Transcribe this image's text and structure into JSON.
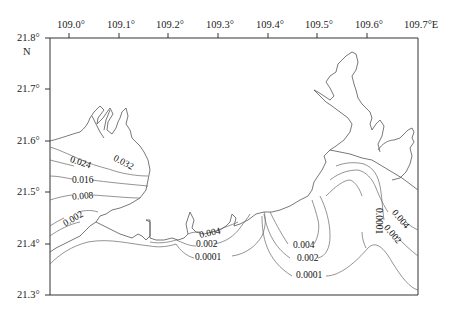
{
  "map": {
    "type": "contour map",
    "frame": {
      "left": 50,
      "right": 418,
      "top": 38,
      "bottom": 295
    },
    "longitude_ticks": [
      {
        "label": "109.0°",
        "x": 69
      },
      {
        "label": "109.1°",
        "x": 119
      },
      {
        "label": "109.2°",
        "x": 168
      },
      {
        "label": "109.3°",
        "x": 218
      },
      {
        "label": "109.4°",
        "x": 268
      },
      {
        "label": "109.5°",
        "x": 317
      },
      {
        "label": "109.6°",
        "x": 367
      },
      {
        "label": "109.7°E",
        "x": 418
      }
    ],
    "latitude_ticks": [
      {
        "label": "21.8°",
        "y": 38
      },
      {
        "label": "21.7°",
        "y": 89
      },
      {
        "label": "21.6°",
        "y": 141
      },
      {
        "label": "21.5°",
        "y": 192
      },
      {
        "label": "21.4°",
        "y": 244
      },
      {
        "label": "21.3°",
        "y": 295
      }
    ],
    "north_label": "N",
    "contour_labels": [
      {
        "text": "0.024",
        "x": 70,
        "y": 165,
        "rot": 18
      },
      {
        "text": "0.032",
        "x": 113,
        "y": 165,
        "rot": 28
      },
      {
        "text": "0.016",
        "x": 72,
        "y": 181,
        "rot": 0
      },
      {
        "text": "0.008",
        "x": 72,
        "y": 197,
        "rot": -5
      },
      {
        "text": "0.002",
        "x": 62,
        "y": 220,
        "rot": -30
      },
      {
        "text": "0.004",
        "x": 200,
        "y": 235,
        "rot": -12
      },
      {
        "text": "0.002",
        "x": 196,
        "y": 244,
        "rot": 0
      },
      {
        "text": "0.0001",
        "x": 196,
        "y": 256,
        "rot": 0
      },
      {
        "text": "0.004",
        "x": 294,
        "y": 246,
        "rot": 0
      },
      {
        "text": "0.002",
        "x": 298,
        "y": 258,
        "rot": 0
      },
      {
        "text": "0.0001",
        "x": 297,
        "y": 276,
        "rot": 0
      },
      {
        "text": "0.0001",
        "x": 361,
        "y": 214,
        "rot": 90
      },
      {
        "text": "0.004",
        "x": 397,
        "y": 217,
        "rot": 50
      },
      {
        "text": "0.002",
        "x": 389,
        "y": 232,
        "rot": 50
      }
    ],
    "contour_levels": [
      "0.032",
      "0.024",
      "0.016",
      "0.008",
      "0.004",
      "0.002",
      "0.0001"
    ],
    "colors": {
      "frame": "#333333",
      "coast": "#555555",
      "contour": "#666666",
      "text": "#222222"
    }
  }
}
